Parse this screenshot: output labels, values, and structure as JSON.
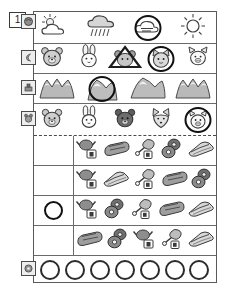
{
  "worksheet": {
    "question_number": "1",
    "rows": [
      {
        "id": "weather-row",
        "tab_icon": "weather-tab-icon",
        "items": [
          {
            "icon": "sun-behind-cloud-icon",
            "selected": false,
            "mark": "none"
          },
          {
            "icon": "rain-cloud-icon",
            "selected": false,
            "mark": "none"
          },
          {
            "icon": "cloud-wind-icon",
            "selected": true,
            "mark": "circle"
          },
          {
            "icon": "sun-icon",
            "selected": false,
            "mark": "none"
          }
        ]
      },
      {
        "id": "animal-row-1",
        "tab_icon": "moon-tab-icon",
        "items": [
          {
            "icon": "bear-face-icon",
            "selected": false,
            "mark": "none"
          },
          {
            "icon": "rabbit-face-icon",
            "selected": false,
            "mark": "none"
          },
          {
            "icon": "mouse-face-icon",
            "selected": false,
            "mark": "triangle"
          },
          {
            "icon": "cat-face-icon",
            "selected": true,
            "mark": "circle"
          },
          {
            "icon": "pig-face-icon",
            "selected": false,
            "mark": "none"
          }
        ]
      },
      {
        "id": "mountain-row",
        "tab_icon": "stamp-tab-icon",
        "items": [
          {
            "icon": "mountain-icon",
            "selected": false,
            "mark": "none"
          },
          {
            "icon": "mountain-icon",
            "selected": true,
            "mark": "circle"
          },
          {
            "icon": "mountain-icon",
            "selected": false,
            "mark": "none"
          },
          {
            "icon": "mountain-icon",
            "selected": false,
            "mark": "none"
          }
        ]
      },
      {
        "id": "animal-row-2",
        "tab_icon": "animal-tab-icon",
        "items": [
          {
            "icon": "bear-face-icon",
            "selected": false,
            "mark": "none"
          },
          {
            "icon": "rabbit-face-icon",
            "selected": false,
            "mark": "none"
          },
          {
            "icon": "dark-bear-face-icon",
            "selected": false,
            "mark": "none"
          },
          {
            "icon": "fox-face-icon",
            "selected": false,
            "mark": "none"
          },
          {
            "icon": "pig-face-icon",
            "selected": true,
            "mark": "circle"
          }
        ]
      }
    ],
    "food_rows": [
      {
        "id": "food-row-1",
        "gutter_mark": "none",
        "items": [
          "chicken-rice-icon",
          "bread-loaf-icon",
          "meat-leg-icon",
          "donut-icon",
          "sandwich-icon"
        ]
      },
      {
        "id": "food-row-2",
        "gutter_mark": "none",
        "items": [
          "chicken-rice-icon",
          "sandwich-icon",
          "meat-leg-icon",
          "bread-loaf-icon",
          "donut-icon"
        ]
      },
      {
        "id": "food-row-3",
        "gutter_mark": "circle",
        "items": [
          "chicken-rice-icon",
          "donut-icon",
          "meat-leg-icon",
          "bread-loaf-icon",
          "sandwich-icon"
        ]
      },
      {
        "id": "food-row-4",
        "gutter_mark": "none",
        "items": [
          "bread-loaf-icon",
          "donut-icon",
          "chicken-rice-icon",
          "meat-leg-icon",
          "sandwich-icon"
        ]
      }
    ],
    "answer_row": {
      "id": "answer-row",
      "tab_icon": "answer-tab-icon",
      "bubble_count": 7,
      "bubbles": [
        "",
        "",
        "",
        "",
        "",
        "",
        ""
      ]
    },
    "colors": {
      "ink": "#2b2b2b",
      "frame": "#5a5a5a",
      "fill_light": "#dcdcdc",
      "fill_mid": "#9a9a9a",
      "fill_dark": "#585858",
      "paper": "#ffffff"
    }
  }
}
